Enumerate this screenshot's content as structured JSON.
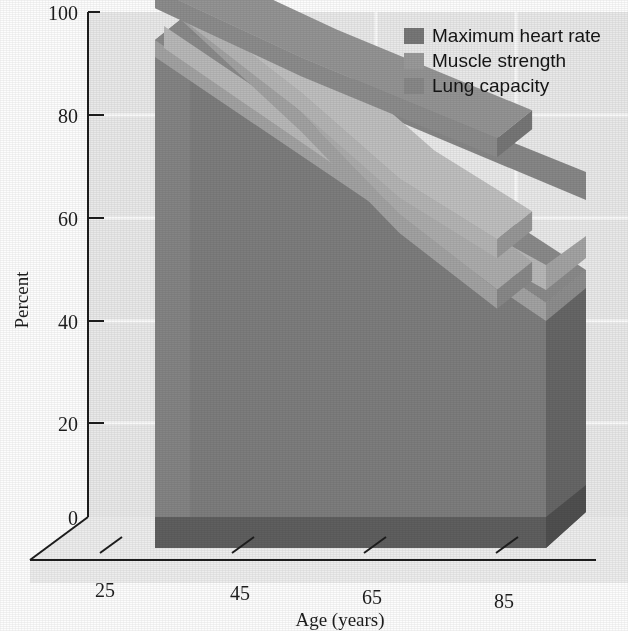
{
  "chart_data": {
    "type": "area",
    "title": "",
    "subtitle": "",
    "xlabel": "Age (years)",
    "ylabel": "Percent",
    "xlim": [
      15,
      95
    ],
    "ylim": [
      0,
      100
    ],
    "grid": true,
    "legend_position": "top-right",
    "projection": "3d",
    "x": [
      25,
      45,
      65,
      85
    ],
    "xtick_labels": [
      "25",
      "45",
      "65",
      "85"
    ],
    "ytick_labels": [
      "0",
      "20",
      "40",
      "60",
      "80",
      "100"
    ],
    "ytick_values": [
      0,
      20,
      40,
      60,
      80,
      100
    ],
    "series": [
      {
        "name": "Maximum heart rate",
        "color": "#8c8c8c",
        "values": [
          100,
          91,
          83,
          75
        ]
      },
      {
        "name": "Muscle strength",
        "color": "#b4b4b4",
        "values": [
          99,
          84,
          67,
          55
        ]
      },
      {
        "name": "Lung capacity",
        "color": "#a2a2a2",
        "values": [
          98,
          80,
          60,
          45
        ]
      }
    ]
  },
  "axes": {
    "y_label": "Percent",
    "x_label": "Age (years)",
    "y_ticks": [
      "100",
      "80",
      "60",
      "40",
      "20",
      "0"
    ],
    "x_ticks": [
      "25",
      "45",
      "65",
      "85"
    ]
  },
  "legend": {
    "items": [
      {
        "label": "Maximum heart rate",
        "swatch": "#777777"
      },
      {
        "label": "Muscle strength",
        "swatch": "#9a9a9a"
      },
      {
        "label": "Lung capacity",
        "swatch": "#888888"
      }
    ]
  },
  "colors": {
    "wall": "#e9e9e9",
    "floor": "#eeeeee",
    "gridline": "#fbfbfb",
    "body": "#7d7d7d",
    "body_side": "#6a6a6a",
    "body_front_dark": "#5f5f5f",
    "band_heart": "#8c8c8c",
    "band_muscle": "#b8b8b8",
    "band_lung": "#a2a2a2",
    "axis": "#1d1d1d",
    "text": "#1d1d1d",
    "page": "#fdfdfd"
  }
}
